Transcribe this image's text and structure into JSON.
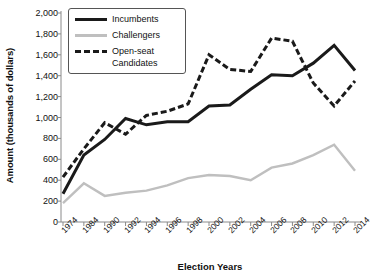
{
  "chart_data": {
    "type": "line",
    "title": "",
    "xlabel": "Election Years",
    "ylabel": "Amount (thousands of dollars)",
    "categories": [
      "1974",
      "1984",
      "1990",
      "1992",
      "1994",
      "1996",
      "1998",
      "2000",
      "2002",
      "2004",
      "2006",
      "2008",
      "2010",
      "2012",
      "2014"
    ],
    "ylim": [
      0,
      2000
    ],
    "yticks": [
      "0",
      "200",
      "400",
      "600",
      "800",
      "1,000",
      "1,200",
      "1,400",
      "1,600",
      "1,800",
      "2,000"
    ],
    "ytick_values": [
      0,
      200,
      400,
      600,
      800,
      1000,
      1200,
      1400,
      1600,
      1800,
      2000
    ],
    "grid": false,
    "legend_position": "top-left",
    "series": [
      {
        "name": "Incumbents",
        "style": "solid",
        "color": "#1a1a1a",
        "values": [
          270,
          640,
          790,
          990,
          930,
          960,
          960,
          1110,
          1120,
          1270,
          1410,
          1400,
          1520,
          1690,
          1450
        ]
      },
      {
        "name": "Challengers",
        "style": "solid",
        "color": "#bfbfbf",
        "values": [
          180,
          370,
          250,
          280,
          300,
          350,
          420,
          450,
          440,
          400,
          520,
          560,
          640,
          740,
          490
        ]
      },
      {
        "name": "Open-seat Candidates",
        "style": "dashed",
        "color": "#1a1a1a",
        "values": [
          430,
          700,
          950,
          840,
          1020,
          1060,
          1130,
          1600,
          1460,
          1440,
          1760,
          1730,
          1330,
          1110,
          1350
        ]
      }
    ]
  },
  "legend": {
    "items": [
      {
        "label": "Incumbents"
      },
      {
        "label": "Challengers"
      },
      {
        "label": "Open-seat"
      },
      {
        "label": "Candidates"
      }
    ]
  }
}
